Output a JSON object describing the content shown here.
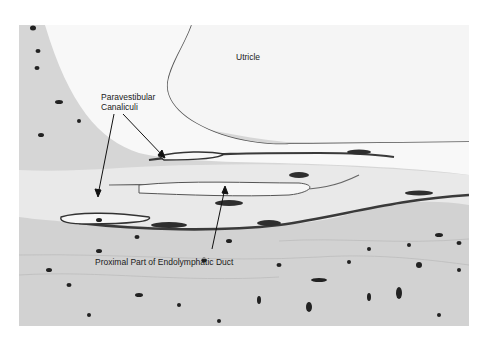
{
  "figure": {
    "type": "histology micrograph",
    "labels": {
      "utricle": "Utricle",
      "paravestibular_line1": "Paravestibular",
      "paravestibular_line2": "Canaliculi",
      "endolymphatic": "Proximal Part of Endolymphatic Duct"
    },
    "colors": {
      "background": "#ffffff",
      "bone": "#d6d6d6",
      "lumen": "#f4f4f4",
      "stain_dark": "#2a2a2a",
      "tissue_mid": "#8a8a8a"
    }
  }
}
